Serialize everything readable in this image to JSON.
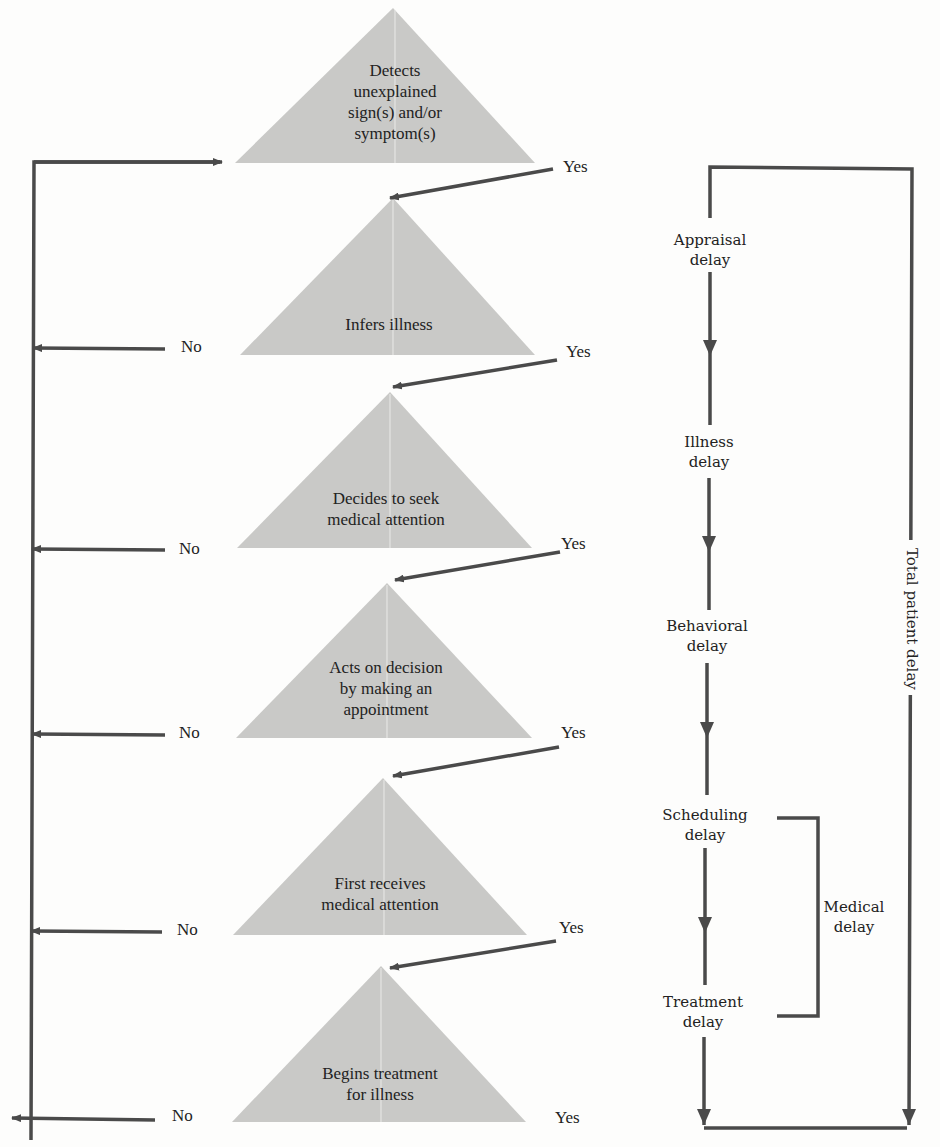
{
  "diagram": {
    "steps": [
      {
        "label": "Detects unexplained sign(s) and/or symptom(s)",
        "lines": [
          "Detects",
          "unexplained",
          "sign(s) and/or",
          "symptom(s)"
        ]
      },
      {
        "label": "Infers illness",
        "lines": [
          "Infers illness"
        ]
      },
      {
        "label": "Decides to seek medical attention",
        "lines": [
          "Decides to seek",
          "medical attention"
        ]
      },
      {
        "label": "Acts on decision by making an appointment",
        "lines": [
          "Acts on decision",
          "by making an",
          "appointment"
        ]
      },
      {
        "label": "First receives medical attention",
        "lines": [
          "First receives",
          "medical attention"
        ]
      },
      {
        "label": "Begins treatment for illness",
        "lines": [
          "Begins treatment",
          "for illness"
        ]
      }
    ],
    "branches": {
      "yes": "Yes",
      "no": "No"
    },
    "delays": [
      {
        "lines": [
          "Appraisal",
          "delay"
        ]
      },
      {
        "lines": [
          "Illness",
          "delay"
        ]
      },
      {
        "lines": [
          "Behavioral",
          "delay"
        ]
      },
      {
        "lines": [
          "Scheduling",
          "delay"
        ]
      },
      {
        "lines": [
          "Treatment",
          "delay"
        ]
      }
    ],
    "medical_delay": {
      "lines": [
        "Medical",
        "delay"
      ]
    },
    "total_delay": "Total patient delay"
  },
  "colors": {
    "triangle_fill": "#c9c9c7",
    "line": "#4a4a4a",
    "background": "#fdfdfc"
  }
}
